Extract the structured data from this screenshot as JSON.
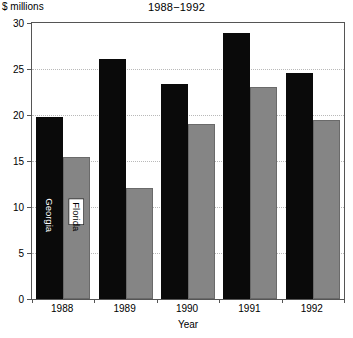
{
  "chart_data": {
    "type": "bar",
    "title": "1988−1992",
    "xlabel": "Year",
    "ylabel": "$ millions",
    "categories": [
      "1988",
      "1989",
      "1990",
      "1991",
      "1992"
    ],
    "series": [
      {
        "name": "Georgia",
        "values": [
          19.8,
          26.1,
          23.4,
          28.9,
          24.6
        ],
        "color": "#0a0a0a"
      },
      {
        "name": "Florida",
        "values": [
          15.4,
          12.1,
          19.0,
          23.0,
          19.5
        ],
        "color": "#858585"
      }
    ],
    "ylim": [
      0,
      30
    ],
    "yticks": [
      0,
      5,
      10,
      15,
      20,
      25,
      30
    ],
    "ytick_labels": [
      "0",
      "5",
      "10",
      "15",
      "20",
      "25",
      "30"
    ],
    "grid": "horizontal-dotted",
    "legend": "in-bar-rotated-labels",
    "legend_position": "inside-first-group"
  }
}
